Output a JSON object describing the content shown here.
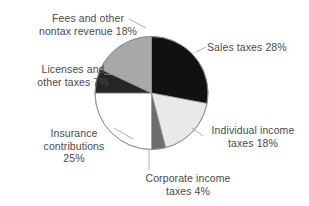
{
  "chart_data": {
    "type": "pie",
    "title": "",
    "subtitle": "",
    "xlabel": "",
    "ylabel": "",
    "legend": "none",
    "grid": false,
    "start_angle_deg": 0,
    "direction": "clockwise",
    "categories": [
      "Sales taxes",
      "Individual income taxes",
      "Corporate income taxes",
      "Insurance contributions",
      "Licenses and other taxes",
      "Fees and other nontax revenue"
    ],
    "values": [
      28,
      18,
      4,
      25,
      7,
      18
    ],
    "value_unit": "%",
    "slices": [
      {
        "name": "Sales taxes",
        "value": 28,
        "value_text": "28%",
        "color": "#111111",
        "label_lines": [
          "Sales taxes 28%"
        ],
        "label_align": "left"
      },
      {
        "name": "Individual income taxes",
        "value": 18,
        "value_text": "18%",
        "color": "#e9e9e9",
        "label_lines": [
          "Individual income",
          "taxes 18%"
        ],
        "label_align": "center"
      },
      {
        "name": "Corporate income taxes",
        "value": 4,
        "value_text": "4%",
        "color": "#6e6e6e",
        "label_lines": [
          "Corporate income",
          "taxes 4%"
        ],
        "label_align": "center"
      },
      {
        "name": "Insurance contributions",
        "value": 25,
        "value_text": "25%",
        "color": "#ffffff",
        "label_lines": [
          "Insurance",
          "contributions",
          "25%"
        ],
        "label_align": "center"
      },
      {
        "name": "Licenses and other taxes",
        "value": 7,
        "value_text": "7%",
        "color": "#262626",
        "label_lines": [
          "Licenses and",
          "other taxes 7%"
        ],
        "label_align": "center"
      },
      {
        "name": "Fees and other nontax revenue",
        "value": 18,
        "value_text": "18%",
        "color": "#a9a9a9",
        "label_lines": [
          "Fees and other",
          "nontax revenue 18%"
        ],
        "label_align": "center"
      }
    ],
    "colors": {
      "background": "#ffffff",
      "outline": "#8d8d8d",
      "text": "#4a4a4a",
      "leader_line": "#9a9a9a"
    }
  },
  "labels": {
    "sales": {
      "l1": "Sales taxes 28%"
    },
    "individual": {
      "l1": "Individual income",
      "l2": "taxes 18%"
    },
    "corporate": {
      "l1": "Corporate income",
      "l2": "taxes 4%"
    },
    "insurance": {
      "l1": "Insurance",
      "l2": "contributions",
      "l3": "25%"
    },
    "licenses": {
      "l1": "Licenses and",
      "l2": "other taxes 7%"
    },
    "fees": {
      "l1": "Fees and other",
      "l2": "nontax revenue 18%"
    }
  }
}
